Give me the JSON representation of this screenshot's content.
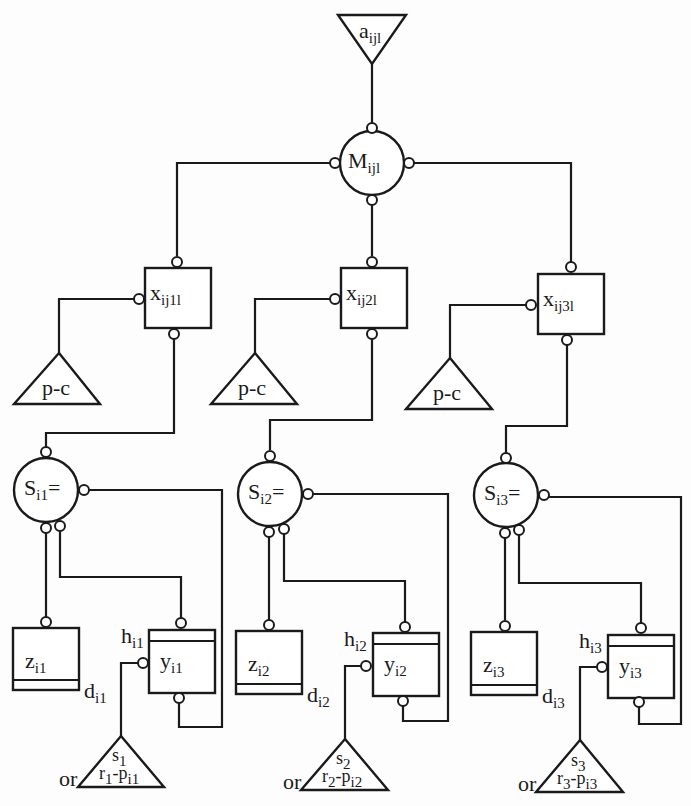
{
  "diagram": {
    "top_input": {
      "base": "a",
      "sub": "ijl"
    },
    "hub": {
      "base": "M",
      "sub": "ijl"
    },
    "branches": [
      {
        "x": {
          "base": "x",
          "sub": "ij1l"
        },
        "pc": "p-c",
        "s": {
          "base": "S",
          "sub": "i1",
          "suffix": "="
        },
        "z": {
          "base": "z",
          "sub": "i1"
        },
        "d": {
          "base": "d",
          "sub": "i1"
        },
        "h": {
          "base": "h",
          "sub": "i1"
        },
        "y": {
          "base": "y",
          "sub": "i1"
        },
        "tri_top": "s",
        "tri_top_sub": "1",
        "tri_bot": "r",
        "tri_bot_sub": "1",
        "tri_bot_rest": "-p",
        "tri_bot_rest_sub": "i1",
        "or": "or"
      },
      {
        "x": {
          "base": "x",
          "sub": "ij2l"
        },
        "pc": "p-c",
        "s": {
          "base": "S",
          "sub": "i2",
          "suffix": "="
        },
        "z": {
          "base": "z",
          "sub": "i2"
        },
        "d": {
          "base": "d",
          "sub": "i2"
        },
        "h": {
          "base": "h",
          "sub": "i2"
        },
        "y": {
          "base": "y",
          "sub": "i2"
        },
        "tri_top": "s",
        "tri_top_sub": "2",
        "tri_bot": "r",
        "tri_bot_sub": "2",
        "tri_bot_rest": "-p",
        "tri_bot_rest_sub": "i2",
        "or": "or"
      },
      {
        "x": {
          "base": "x",
          "sub": "ij3l"
        },
        "pc": "p-c",
        "s": {
          "base": "S",
          "sub": "i3",
          "suffix": "="
        },
        "z": {
          "base": "z",
          "sub": "i3"
        },
        "d": {
          "base": "d",
          "sub": "i3"
        },
        "h": {
          "base": "h",
          "sub": "i3"
        },
        "y": {
          "base": "y",
          "sub": "i3"
        },
        "tri_top": "s",
        "tri_top_sub": "3",
        "tri_bot": "r",
        "tri_bot_sub": "3",
        "tri_bot_rest": "-p",
        "tri_bot_rest_sub": "i3",
        "or": "or"
      }
    ]
  }
}
